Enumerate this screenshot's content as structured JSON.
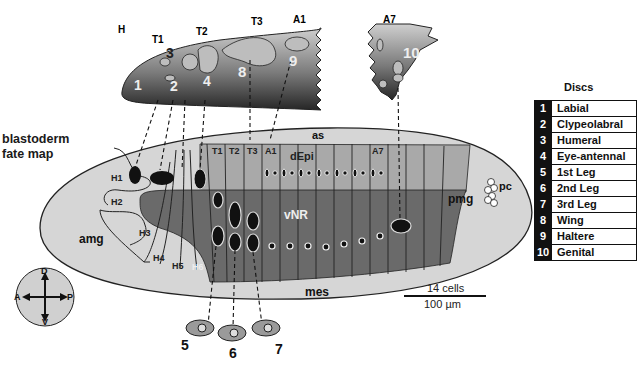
{
  "figure": {
    "title_line1": "blastoderm",
    "title_line2": "fate map"
  },
  "larva": {
    "segments": [
      "H",
      "T1",
      "T2",
      "T3",
      "A1",
      "A7"
    ],
    "disc_numbers": [
      "1",
      "2",
      "3",
      "4",
      "8",
      "9",
      "10"
    ]
  },
  "fate_map": {
    "regions": {
      "as": "as",
      "dEpi": "dEpi",
      "vNR": "vNR",
      "mes": "mes",
      "amg": "amg",
      "pmg": "pmg",
      "pc": "pc"
    },
    "head_segments": [
      "H1",
      "H2",
      "H3",
      "H4",
      "H5",
      "H6"
    ],
    "trunk_segments": [
      "T1",
      "T2",
      "T3",
      "A1",
      "A7"
    ]
  },
  "leg_discs": [
    "5",
    "6",
    "7"
  ],
  "compass": {
    "dorsal": "D",
    "ventral": "V",
    "anterior": "A",
    "posterior": "P"
  },
  "scale_bar": {
    "cells": "14 cells",
    "length": "100 µm"
  },
  "legend": {
    "title": "Discs",
    "items": [
      {
        "num": "1",
        "name": "Labial"
      },
      {
        "num": "2",
        "name": "Clypeolabral"
      },
      {
        "num": "3",
        "name": "Humeral"
      },
      {
        "num": "4",
        "name": "Eye-antennal"
      },
      {
        "num": "5",
        "name": "1st Leg"
      },
      {
        "num": "6",
        "name": "2nd Leg"
      },
      {
        "num": "7",
        "name": "3rd Leg"
      },
      {
        "num": "8",
        "name": "Wing"
      },
      {
        "num": "9",
        "name": "Haltere"
      },
      {
        "num": "10",
        "name": "Genital"
      }
    ]
  },
  "colors": {
    "embryo_fill": "#d6d6d6",
    "dEpi_fill": "#a9a9a9",
    "vNR_fill": "#6a6a6a",
    "larva_dark": "#3a3a3a",
    "legend_number_bg": "#111111"
  }
}
